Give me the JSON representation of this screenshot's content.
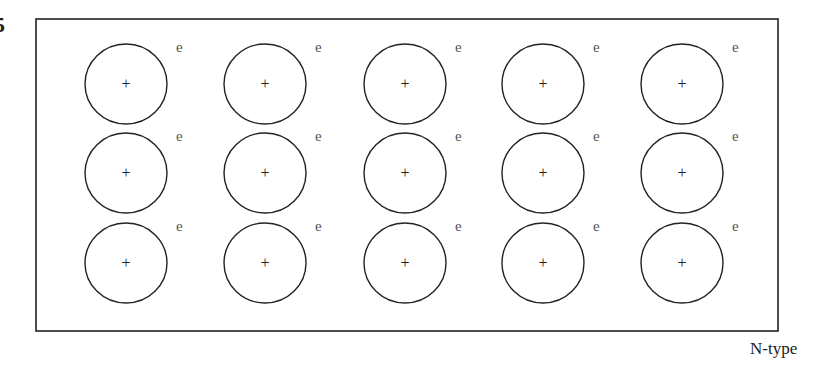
{
  "figure_number": "5",
  "caption": "N-type",
  "lattice": {
    "rows": 3,
    "columns": 5,
    "ion_symbol": "+",
    "electron_symbol": "e",
    "column_centers_x": [
      126,
      265,
      405,
      543,
      682
    ],
    "row_centers_y": [
      84,
      173,
      263
    ],
    "ion_radius": 41
  },
  "box": {
    "x": 36,
    "y": 19,
    "width": 742,
    "height": 312
  },
  "colors": {
    "stroke": "#222222",
    "electron": "#555555",
    "background": "#ffffff"
  }
}
